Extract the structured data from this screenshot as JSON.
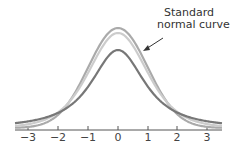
{
  "annotation": {
    "line1": "Standard",
    "line2": "normal curve"
  },
  "axis": {
    "ticks": [
      {
        "label": "−3",
        "x": 28
      },
      {
        "label": "−2",
        "x": 58
      },
      {
        "label": "−1",
        "x": 88
      },
      {
        "label": "0",
        "x": 118
      },
      {
        "label": "1",
        "x": 148
      },
      {
        "label": "2",
        "x": 177
      },
      {
        "label": "3",
        "x": 207
      }
    ]
  },
  "curves": [
    {
      "name": "standard-normal",
      "color": "#aaaaaa",
      "peak_y": 28
    },
    {
      "name": "t-distribution-high-df",
      "color": "#cccccc",
      "peak_y": 33
    },
    {
      "name": "t-distribution-low-df",
      "color": "#777777",
      "peak_y": 50
    }
  ]
}
